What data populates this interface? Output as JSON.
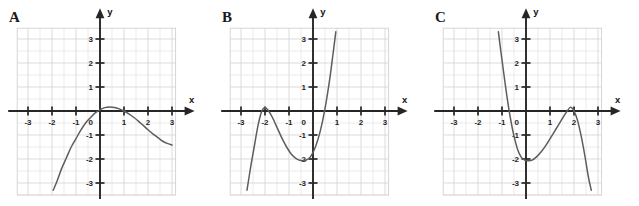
{
  "figure": {
    "background": "#ffffff",
    "curve_color": "#5d5d5d",
    "axis_color": "#262626",
    "grid_color": "#e2e2e4"
  },
  "axes_common": {
    "x_label": "x",
    "y_label": "y",
    "origin_label": "0",
    "x_ticks": [
      -3,
      -2,
      -1,
      1,
      2,
      3
    ],
    "y_ticks": [
      3,
      2,
      1,
      -1,
      -2,
      -3
    ],
    "x_tick_labels": [
      "-3",
      "-2",
      "-1",
      "1",
      "2",
      "3"
    ],
    "y_tick_labels": [
      "3",
      "2",
      "1",
      "-1",
      "-2",
      "-3"
    ],
    "xlim": [
      -3.3,
      3.3
    ],
    "ylim": [
      -3.3,
      3.3
    ],
    "grid": true,
    "minor_grid_step": 0.5
  },
  "panels": [
    {
      "id": "A",
      "label": "A",
      "chart_data": {
        "type": "line",
        "title": "A",
        "xlabel": "x",
        "ylabel": "y",
        "xlim": [
          -3.3,
          3.3
        ],
        "ylim": [
          -3.3,
          3.3
        ],
        "grid": true,
        "legend": "none",
        "description": "Downward trending cubic: rises steeply from lower left, flattens near a shallow local maximum just above the x-axis around x = 0.4, then decreases to the right.",
        "x": [
          -1.95,
          -1.8,
          -1.6,
          -1.4,
          -1.2,
          -1.0,
          -0.8,
          -0.6,
          -0.4,
          -0.2,
          0.0,
          0.2,
          0.4,
          0.6,
          0.8,
          1.0,
          1.2,
          1.4,
          1.6,
          1.8,
          2.0,
          2.2,
          2.4,
          2.6,
          2.8,
          3.0
        ],
        "y": [
          -3.3,
          -2.95,
          -2.4,
          -1.95,
          -1.5,
          -1.15,
          -0.8,
          -0.5,
          -0.28,
          -0.08,
          0.05,
          0.14,
          0.17,
          0.15,
          0.09,
          0.0,
          -0.12,
          -0.26,
          -0.42,
          -0.6,
          -0.78,
          -0.95,
          -1.1,
          -1.25,
          -1.35,
          -1.42
        ]
      }
    },
    {
      "id": "B",
      "label": "B",
      "chart_data": {
        "type": "line",
        "title": "B",
        "xlabel": "x",
        "ylabel": "y",
        "xlim": [
          -3.3,
          3.3
        ],
        "ylim": [
          -3.3,
          3.3
        ],
        "grid": true,
        "legend": "none",
        "description": "Increasing cubic with local maximum at about (-2, 0.15) touching the x-axis, local minimum at about (-0.25, -2.05), crossing the x-axis near x = 0.6 and rising off the top of the frame near x = 0.95.",
        "local_max": [
          -2.0,
          0.15
        ],
        "local_min": [
          -0.25,
          -2.05
        ],
        "x_intercepts": [
          -2.15,
          -1.85,
          0.6
        ],
        "x": [
          -2.75,
          -2.6,
          -2.45,
          -2.3,
          -2.15,
          -2.0,
          -1.85,
          -1.7,
          -1.5,
          -1.3,
          -1.1,
          -0.9,
          -0.7,
          -0.5,
          -0.3,
          -0.1,
          0.1,
          0.3,
          0.5,
          0.7,
          0.85,
          0.95
        ],
        "y": [
          -3.3,
          -2.35,
          -1.5,
          -0.65,
          -0.05,
          0.15,
          0.0,
          -0.25,
          -0.68,
          -1.12,
          -1.5,
          -1.8,
          -1.98,
          -2.06,
          -2.05,
          -1.9,
          -1.5,
          -0.85,
          0.1,
          1.35,
          2.5,
          3.3
        ]
      }
    },
    {
      "id": "C",
      "label": "C",
      "chart_data": {
        "type": "line",
        "title": "C",
        "xlabel": "x",
        "ylabel": "y",
        "xlim": [
          -3.3,
          3.3
        ],
        "ylim": [
          -3.3,
          3.3
        ],
        "grid": true,
        "legend": "none",
        "description": "Decreasing cubic, mirror image of panel B: falls steeply from the top of the frame near x = -1.15, crosses the x-axis at about x = -0.8, reaches a local minimum at about (0.2, -2.05), rises to a local maximum at about (1.85, 0.15) touching the x-axis, then falls steeply off the bottom near x = 2.7.",
        "local_min": [
          0.2,
          -2.05
        ],
        "local_max": [
          1.85,
          0.15
        ],
        "x_intercepts": [
          -0.8,
          1.7,
          2.0
        ],
        "x": [
          -1.15,
          -1.05,
          -0.95,
          -0.8,
          -0.65,
          -0.5,
          -0.35,
          -0.2,
          -0.05,
          0.1,
          0.25,
          0.45,
          0.65,
          0.85,
          1.05,
          1.25,
          1.45,
          1.65,
          1.85,
          2.0,
          2.15,
          2.3,
          2.45,
          2.6,
          2.72
        ],
        "y": [
          3.3,
          2.5,
          1.75,
          0.65,
          -0.3,
          -1.05,
          -1.6,
          -1.92,
          -2.05,
          -2.07,
          -2.05,
          -1.9,
          -1.68,
          -1.4,
          -1.08,
          -0.75,
          -0.42,
          -0.1,
          0.15,
          0.0,
          -0.4,
          -1.05,
          -1.85,
          -2.75,
          -3.3
        ]
      }
    }
  ]
}
